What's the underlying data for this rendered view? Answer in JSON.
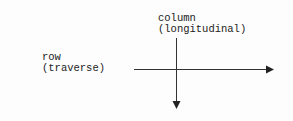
{
  "diagram": {
    "column_label": {
      "line1": "column",
      "line2": "(longitudinal)"
    },
    "row_label": {
      "line1": "row",
      "line2": "(traverse)"
    },
    "axes": {
      "horizontal": {
        "direction": "right",
        "label": "row (traverse)"
      },
      "vertical": {
        "direction": "down",
        "label": "column (longitudinal)"
      }
    },
    "colors": {
      "line": "#333333",
      "text": "#222222",
      "background": "#fdfdfd"
    }
  }
}
